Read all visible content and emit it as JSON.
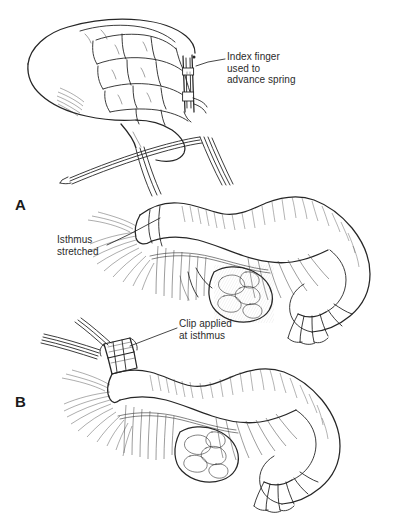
{
  "figure": {
    "background_color": "#ffffff",
    "ink_color": "#262626",
    "width": 405,
    "height": 529,
    "style": "pen-and-ink line drawing with cross-hatching"
  },
  "panels": [
    {
      "letter": "A",
      "description": "Surgeon's hand gripping clip applicator; instrument shafts pass down to the fallopian tube; isthmus stretched"
    },
    {
      "letter": "B",
      "description": "Clip closed on the isthmus of the fallopian tube with mesosalpinx and fimbriated end shown"
    }
  ],
  "callouts": [
    {
      "id": "index-finger",
      "text": "Index finger\nused to\nadvance spring",
      "leader_from": [
        227,
        59
      ],
      "leader_to": [
        196,
        66
      ]
    },
    {
      "id": "isthmus",
      "text": "Isthmus\nstretched",
      "leader_from": [
        108,
        245
      ],
      "leader_to": [
        160,
        218
      ]
    },
    {
      "id": "clip",
      "text": "Clip applied\nat isthmus",
      "leader_from": [
        178,
        328
      ],
      "leader_to": [
        130,
        346
      ]
    }
  ]
}
